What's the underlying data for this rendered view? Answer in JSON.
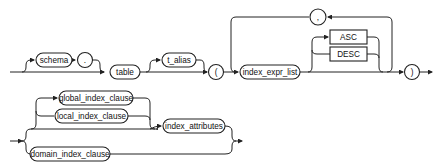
{
  "diagram": {
    "type": "railroad-syntax-diagram",
    "row1": {
      "schema": "schema",
      "dot": ".",
      "table": "table",
      "t_alias": "t_alias",
      "open_paren": "(",
      "index_expr_list": "index_expr_list",
      "asc": "ASC",
      "desc": "DESC",
      "comma": ",",
      "close_paren": ")"
    },
    "row2": {
      "global_index_clause": "global_index_clause",
      "local_index_clause": "local_index_clause",
      "index_attributes": "index_attributes",
      "domain_index_clause": "domain_index_clause"
    }
  }
}
